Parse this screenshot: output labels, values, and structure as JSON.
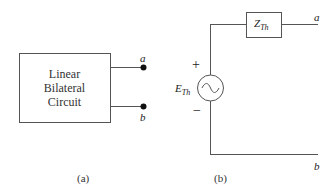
{
  "figure_a": {
    "box_lines": [
      "Linear",
      "Bilateral",
      "Circuit"
    ],
    "terminal_top": "a",
    "terminal_bottom": "b",
    "caption": "(a)"
  },
  "figure_b": {
    "impedance_main": "Z",
    "impedance_sub": "Th",
    "source_main": "E",
    "source_sub": "Th",
    "plus": "+",
    "minus": "−",
    "terminal_top": "a",
    "terminal_bottom": "b",
    "caption": "(b)"
  },
  "colors": {
    "line": "#555555",
    "dot": "#111111"
  }
}
